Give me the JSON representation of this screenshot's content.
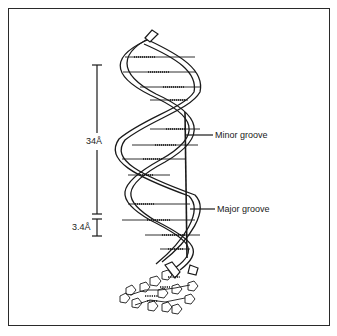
{
  "diagram": {
    "labels": {
      "pitch": "34Å",
      "rise": "3.4Å",
      "minor_groove": "Minor groove",
      "major_groove": "Major groove"
    },
    "colors": {
      "ink": "#1a1a1a",
      "background": "#ffffff",
      "frame": "#2a2a2a"
    }
  }
}
